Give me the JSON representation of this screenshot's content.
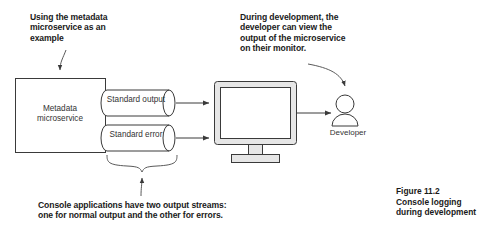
{
  "figure": {
    "caption": "Figure 11.2\nConsole logging\nduring development"
  },
  "callouts": {
    "source": "Using the metadata\nmicroservice as an\nexample",
    "monitor": "During development, the\ndeveloper can view the\noutput of the microservice\non their monitor.",
    "streams": "Console applications have two output streams:\none for normal output and the other for errors."
  },
  "diagram": {
    "service_box": {
      "label": "Metadata\nmicroservice",
      "name": "metadata-microservice-box"
    },
    "streams": [
      {
        "label": "Standard output",
        "name": "standard-output-cylinder"
      },
      {
        "label": "Standard error",
        "name": "standard-error-cylinder"
      }
    ],
    "monitor": {
      "name": "monitor-icon"
    },
    "actor": {
      "label": "Developer",
      "name": "developer-icon"
    }
  },
  "colors": {
    "stroke": "#3a3a3a",
    "text": "#333333",
    "callout_text": "#1a1a1a",
    "monitor_bezel": "#e6e6e6",
    "monitor_screen": "#ffffff",
    "page_background": "#ffffff"
  }
}
